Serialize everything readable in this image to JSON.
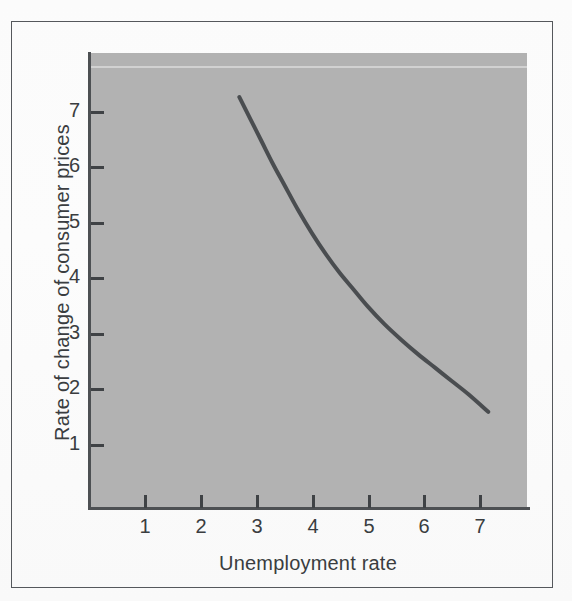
{
  "figure": {
    "kind": "phillips-curve-figure",
    "frame_color": "#55585c",
    "plot_background": "#b2b2b2",
    "page_background": "#fbfbfb",
    "curve_color": "#4a4d50"
  },
  "axes": {
    "x_title": "Unemployment rate",
    "y_title": "Rate of change of consumer prices",
    "x_ticks": [
      "1",
      "2",
      "3",
      "4",
      "5",
      "6",
      "7"
    ],
    "y_ticks": [
      "7",
      "6",
      "5",
      "4",
      "3",
      "2",
      "1"
    ]
  },
  "chart_data": {
    "type": "line",
    "title": "",
    "subtitle": "",
    "xlabel": "Unemployment rate",
    "ylabel": "Rate of change of consumer prices",
    "xlim": [
      0.2,
      7.85
    ],
    "ylim": [
      0.15,
      8.2
    ],
    "xticks": [
      1,
      2,
      3,
      4,
      5,
      6,
      7
    ],
    "yticks": [
      1,
      2,
      3,
      4,
      5,
      6,
      7
    ],
    "grid": false,
    "legend": null,
    "annotations": [],
    "series": [
      {
        "name": "Phillips curve",
        "color": "#4a4d50",
        "line_width": 4,
        "x": [
          2.7,
          2.9,
          3.1,
          3.3,
          3.5,
          3.75,
          4.0,
          4.25,
          4.5,
          4.75,
          5.0,
          5.3,
          5.6,
          5.9,
          6.2,
          6.5,
          6.8,
          7.16
        ],
        "y": [
          7.25,
          6.85,
          6.45,
          6.05,
          5.68,
          5.22,
          4.8,
          4.42,
          4.08,
          3.78,
          3.48,
          3.16,
          2.88,
          2.62,
          2.38,
          2.14,
          1.9,
          1.58
        ]
      }
    ]
  }
}
